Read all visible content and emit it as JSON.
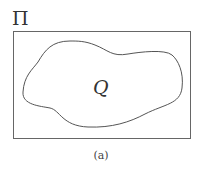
{
  "figure": {
    "outer_label": "Π",
    "inner_label": "Q",
    "caption": "(a)",
    "colors": {
      "stroke": "#555555",
      "text": "#333333",
      "background": "#ffffff"
    }
  }
}
